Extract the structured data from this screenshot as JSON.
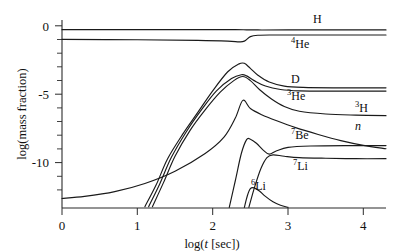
{
  "chart_data": {
    "type": "line",
    "title": "",
    "xlabel": "log(t [sec])",
    "ylabel": "log(mass fraction)",
    "xlim": [
      0,
      4.3
    ],
    "ylim": [
      -13.2,
      0.6
    ],
    "xticks": [
      0,
      1,
      2,
      3,
      4
    ],
    "xtick_labels": [
      "0",
      "1",
      "2",
      "3",
      "4"
    ],
    "yticks": [
      0,
      -5,
      -10
    ],
    "ytick_labels": [
      "0",
      "-5",
      "-10"
    ],
    "yticks_minor": [
      -1,
      -2,
      -3,
      -4,
      -6,
      -7,
      -8,
      -9,
      -11,
      -12
    ],
    "grid": false,
    "legend": "inline-labels",
    "series": [
      {
        "name": "H",
        "label": "H",
        "points": [
          [
            0.0,
            -0.11
          ],
          [
            1.0,
            -0.11
          ],
          [
            2.0,
            -0.11
          ],
          [
            2.3,
            -0.11
          ],
          [
            2.45,
            -0.12
          ],
          [
            2.6,
            -0.13
          ],
          [
            3.0,
            -0.13
          ],
          [
            4.3,
            -0.13
          ]
        ]
      },
      {
        "name": "4He",
        "label": "4He",
        "points": [
          [
            0.0,
            -0.82
          ],
          [
            1.0,
            -0.85
          ],
          [
            1.8,
            -0.9
          ],
          [
            2.2,
            -0.95
          ],
          [
            2.35,
            -1.0
          ],
          [
            2.42,
            -0.95
          ],
          [
            2.5,
            -0.62
          ],
          [
            2.6,
            -0.52
          ],
          [
            2.8,
            -0.5
          ],
          [
            3.2,
            -0.5
          ],
          [
            4.3,
            -0.5
          ]
        ]
      },
      {
        "name": "D",
        "label": "D",
        "points": [
          [
            1.1,
            -13.1
          ],
          [
            1.25,
            -11.5
          ],
          [
            1.4,
            -9.6
          ],
          [
            1.6,
            -7.8
          ],
          [
            1.8,
            -6.2
          ],
          [
            2.0,
            -4.6
          ],
          [
            2.2,
            -3.2
          ],
          [
            2.35,
            -2.62
          ],
          [
            2.42,
            -2.58
          ],
          [
            2.5,
            -2.95
          ],
          [
            2.6,
            -3.45
          ],
          [
            2.75,
            -3.95
          ],
          [
            2.95,
            -4.25
          ],
          [
            3.2,
            -4.35
          ],
          [
            3.6,
            -4.38
          ],
          [
            4.3,
            -4.38
          ]
        ]
      },
      {
        "name": "3He",
        "label": "3He",
        "points": [
          [
            1.15,
            -13.1
          ],
          [
            1.3,
            -11.4
          ],
          [
            1.45,
            -9.5
          ],
          [
            1.65,
            -7.6
          ],
          [
            1.85,
            -6.0
          ],
          [
            2.05,
            -4.6
          ],
          [
            2.25,
            -3.7
          ],
          [
            2.38,
            -3.42
          ],
          [
            2.45,
            -3.5
          ],
          [
            2.55,
            -3.85
          ],
          [
            2.7,
            -4.25
          ],
          [
            2.9,
            -4.5
          ],
          [
            3.15,
            -4.6
          ],
          [
            3.6,
            -4.62
          ],
          [
            4.3,
            -4.62
          ]
        ]
      },
      {
        "name": "3H",
        "label": "3H",
        "points": [
          [
            1.2,
            -13.1
          ],
          [
            1.35,
            -11.3
          ],
          [
            1.5,
            -9.4
          ],
          [
            1.7,
            -7.5
          ],
          [
            1.9,
            -6.0
          ],
          [
            2.1,
            -4.7
          ],
          [
            2.28,
            -3.85
          ],
          [
            2.4,
            -3.55
          ],
          [
            2.5,
            -3.85
          ],
          [
            2.62,
            -4.5
          ],
          [
            2.78,
            -5.2
          ],
          [
            2.95,
            -5.75
          ],
          [
            3.15,
            -6.1
          ],
          [
            3.5,
            -6.3
          ],
          [
            3.9,
            -6.38
          ],
          [
            4.3,
            -6.42
          ]
        ]
      },
      {
        "name": "n",
        "label": "n",
        "points": [
          [
            0.0,
            -12.5
          ],
          [
            0.3,
            -12.35
          ],
          [
            0.7,
            -12.0
          ],
          [
            1.1,
            -11.4
          ],
          [
            1.5,
            -10.5
          ],
          [
            1.9,
            -9.2
          ],
          [
            2.15,
            -8.0
          ],
          [
            2.3,
            -6.6
          ],
          [
            2.4,
            -5.3
          ],
          [
            2.5,
            -5.9
          ],
          [
            2.65,
            -6.35
          ],
          [
            2.85,
            -6.8
          ],
          [
            3.1,
            -7.3
          ],
          [
            3.4,
            -7.8
          ],
          [
            3.7,
            -8.25
          ],
          [
            4.0,
            -8.6
          ],
          [
            4.3,
            -8.85
          ]
        ]
      },
      {
        "name": "7Be",
        "label": "7Be",
        "points": [
          [
            2.22,
            -13.15
          ],
          [
            2.3,
            -11.2
          ],
          [
            2.38,
            -9.2
          ],
          [
            2.45,
            -8.18
          ],
          [
            2.5,
            -8.15
          ],
          [
            2.58,
            -8.45
          ],
          [
            2.67,
            -8.95
          ],
          [
            2.75,
            -9.25
          ],
          [
            2.85,
            -9.0
          ],
          [
            3.0,
            -8.75
          ],
          [
            3.3,
            -8.65
          ],
          [
            3.8,
            -8.62
          ],
          [
            4.3,
            -8.62
          ]
        ]
      },
      {
        "name": "7Li",
        "label": "7Li",
        "points": [
          [
            2.48,
            -13.15
          ],
          [
            2.56,
            -11.6
          ],
          [
            2.64,
            -10.3
          ],
          [
            2.72,
            -9.5
          ],
          [
            2.8,
            -9.3
          ],
          [
            2.95,
            -9.4
          ],
          [
            3.15,
            -9.5
          ],
          [
            3.5,
            -9.55
          ],
          [
            3.9,
            -9.58
          ],
          [
            4.3,
            -9.58
          ]
        ]
      },
      {
        "name": "6Li",
        "label": "6Li",
        "points": [
          [
            2.42,
            -13.15
          ],
          [
            2.46,
            -12.3
          ],
          [
            2.5,
            -11.78
          ],
          [
            2.55,
            -11.72
          ],
          [
            2.62,
            -11.95
          ],
          [
            2.7,
            -12.35
          ],
          [
            2.8,
            -12.75
          ],
          [
            2.9,
            -13.0
          ],
          [
            3.0,
            -13.15
          ]
        ]
      }
    ],
    "curve_labels": [
      {
        "id": "label-H",
        "element": "H",
        "superscript": "",
        "italic": false,
        "x": 313,
        "y": 23
      },
      {
        "id": "label-4He",
        "element": "He",
        "superscript": "4",
        "italic": false,
        "x": 291,
        "y": 48
      },
      {
        "id": "label-D",
        "element": "D",
        "superscript": "",
        "italic": false,
        "x": 291,
        "y": 83
      },
      {
        "id": "label-3He",
        "element": "He",
        "superscript": "3",
        "italic": false,
        "x": 287,
        "y": 100
      },
      {
        "id": "label-3H",
        "element": "H",
        "superscript": "3",
        "italic": false,
        "x": 355,
        "y": 112
      },
      {
        "id": "label-n",
        "element": "n",
        "superscript": "",
        "italic": true,
        "x": 355,
        "y": 130
      },
      {
        "id": "label-7Be",
        "element": "Be",
        "superscript": "7",
        "italic": false,
        "x": 291,
        "y": 139
      },
      {
        "id": "label-7Li",
        "element": "Li",
        "superscript": "7",
        "italic": false,
        "x": 293,
        "y": 170
      },
      {
        "id": "label-6Li",
        "element": "Li",
        "superscript": "6",
        "italic": false,
        "x": 251,
        "y": 190
      }
    ]
  },
  "axes": {
    "x_label_main": "log(",
    "x_label_var": "t",
    "x_label_tail": " [sec])",
    "y_label": "log(mass fraction)"
  }
}
